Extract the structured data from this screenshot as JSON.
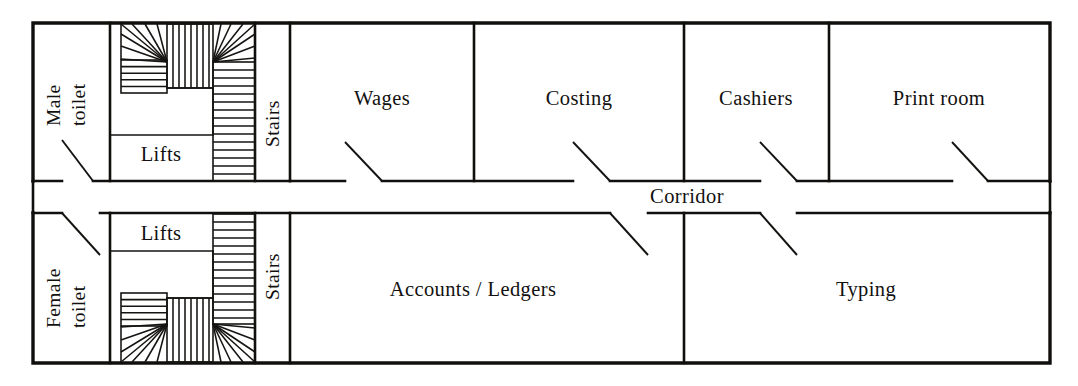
{
  "diagram": {
    "type": "architectural-floor-plan",
    "line_color": "#100f0d",
    "background_color": "#ffffff",
    "width": 1078,
    "height": 386
  },
  "rooms": {
    "male_toilet": {
      "label_line1": "Male",
      "label_line2": "toilet",
      "orientation": "vertical"
    },
    "female_toilet": {
      "label_line1": "Female",
      "label_line2": "toilet",
      "orientation": "vertical"
    },
    "lifts_upper": {
      "label": "Lifts"
    },
    "lifts_lower": {
      "label": "Lifts"
    },
    "stairs_upper": {
      "label": "Stairs",
      "orientation": "vertical"
    },
    "stairs_lower": {
      "label": "Stairs",
      "orientation": "vertical"
    },
    "wages": {
      "label": "Wages"
    },
    "costing": {
      "label": "Costing"
    },
    "cashiers": {
      "label": "Cashiers"
    },
    "print_room": {
      "label": "Print room"
    },
    "corridor": {
      "label": "Corridor"
    },
    "accounts_ledgers": {
      "label": "Accounts / Ledgers"
    },
    "typing": {
      "label": "Typing"
    }
  },
  "room_order_top": [
    "Male toilet",
    "Lifts",
    "Stairs",
    "Wages",
    "Costing",
    "Cashiers",
    "Print room"
  ],
  "room_order_bottom": [
    "Female toilet",
    "Lifts",
    "Stairs",
    "Accounts / Ledgers",
    "Typing"
  ],
  "features": {
    "doors_count": 8,
    "staircases": 2,
    "lift_banks": 2
  }
}
